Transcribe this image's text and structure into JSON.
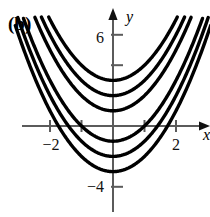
{
  "panel": {
    "label": "(b)"
  },
  "chart_data": {
    "type": "line",
    "title": "",
    "subtitle": "",
    "xlabel": "x",
    "ylabel": "y",
    "grid": false,
    "legend": "none",
    "xlim": [
      -3.1,
      3.1
    ],
    "ylim": [
      -5.6,
      6.8
    ],
    "x_ticks": [
      -2,
      -1,
      1,
      2
    ],
    "x_tick_labels": [
      "−2",
      "",
      "",
      "2"
    ],
    "y_ticks": [
      6,
      4,
      -4
    ],
    "y_tick_labels": [
      "6",
      "",
      "−4"
    ],
    "annotations": [],
    "series": [
      {
        "name": "y = x² + 3",
        "c": 3,
        "vertex": [
          0,
          3
        ]
      },
      {
        "name": "y = x² + 2",
        "c": 2,
        "vertex": [
          0,
          2
        ]
      },
      {
        "name": "y = x² + 1",
        "c": 1,
        "vertex": [
          0,
          1
        ]
      },
      {
        "name": "y = x² − 1",
        "c": -1,
        "vertex": [
          0,
          -1
        ]
      },
      {
        "name": "y = x² − 2",
        "c": -2,
        "vertex": [
          0,
          -2
        ]
      },
      {
        "name": "y = x² − 3",
        "c": -3,
        "vertex": [
          0,
          -3
        ]
      }
    ],
    "axis_arrows": {
      "y_top": true,
      "x_right": true
    }
  },
  "style": {
    "curve_color": "#000000",
    "axis_color": "#5b5b5b",
    "text_color": "#111111",
    "background": "#ffffff"
  }
}
